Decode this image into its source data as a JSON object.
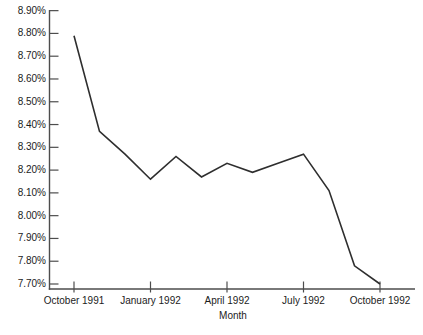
{
  "chart": {
    "xlabel": "Month",
    "y_tick_labels": [
      "8.90%",
      "8.80%",
      "8.70%",
      "8.60%",
      "8.50%",
      "8.40%",
      "8.30%",
      "8.20%",
      "8.10%",
      "8.00%",
      "7.90%",
      "7.80%",
      "7.70%"
    ],
    "x_tick_labels": [
      "October 1991",
      "January 1992",
      "April 1992",
      "July 1992",
      "October 1992"
    ]
  },
  "chart_data": {
    "type": "line",
    "title": "",
    "xlabel": "Month",
    "ylabel": "",
    "categories": [
      "October 1991",
      "November 1991",
      "December 1991",
      "January 1992",
      "February 1992",
      "March 1992",
      "April 1992",
      "May 1992",
      "June 1992",
      "July 1992",
      "August 1992",
      "September 1992",
      "October 1992"
    ],
    "values": [
      8.79,
      8.37,
      8.27,
      8.16,
      8.26,
      8.17,
      8.23,
      8.19,
      8.23,
      8.27,
      8.11,
      7.78,
      7.7
    ],
    "shown_x_tick_labels": [
      "October 1991",
      "January 1992",
      "April 1992",
      "July 1992",
      "October 1992"
    ],
    "shown_x_tick_indices": [
      0,
      3,
      6,
      9,
      12
    ],
    "ylim": [
      7.7,
      8.9
    ],
    "y_tick_step": 0.1,
    "y_tick_format": "0.00%",
    "grid": false,
    "legend": "none",
    "line_color": "#2e2e2e",
    "axis_color": "#4d4d4d",
    "text_color": "#1c1c1c"
  }
}
